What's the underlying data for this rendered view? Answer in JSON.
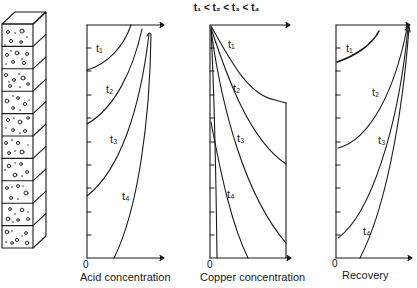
{
  "title": "t₁ < t₂ < t₃ < t₄",
  "column": {
    "label": "packed ore column",
    "segments": 10
  },
  "charts": [
    {
      "id": "acid",
      "xlabel": "Acid concentration",
      "origin": "0",
      "curves": [
        {
          "label": "t₁"
        },
        {
          "label": "t₂"
        },
        {
          "label": "t₃"
        },
        {
          "label": "t₄"
        }
      ]
    },
    {
      "id": "copper",
      "xlabel": "Copper concentration",
      "origin": "0",
      "curves": [
        {
          "label": "t₁"
        },
        {
          "label": "t₂"
        },
        {
          "label": "t₃"
        },
        {
          "label": "t₄"
        }
      ]
    },
    {
      "id": "recovery",
      "xlabel": "Recovery",
      "origin": "0",
      "curves": [
        {
          "label": "t₁"
        },
        {
          "label": "t₂"
        },
        {
          "label": "t₃"
        },
        {
          "label": "t₄"
        }
      ]
    }
  ],
  "colors": {
    "ink": "#1a1a1a",
    "background": "#ffffff"
  }
}
